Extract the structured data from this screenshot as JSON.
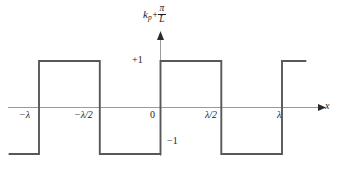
{
  "figure": {
    "width": 338,
    "height": 171,
    "background": "#ffffff",
    "line_color": "#4a4a4a",
    "axis_color": "#8c8c8c",
    "text_color": "#1a1a1a"
  },
  "axes": {
    "y_axis_title": {
      "base": "k",
      "subscript": "p",
      "operator": "+",
      "fraction_numerator": "π",
      "fraction_denominator": "L"
    },
    "x_axis_label": "x",
    "origin_label": "0",
    "y_tick_labels": [
      "+1",
      "−1"
    ],
    "x_tick_labels": [
      "−λ",
      "−λ/2",
      "λ/2",
      "λ"
    ]
  },
  "chart_data": {
    "type": "line",
    "title": "",
    "xlabel": "x",
    "ylabel": "k_p + π/L",
    "grid": false,
    "legend": "none",
    "xlim": [
      -1.25,
      1.32
    ],
    "ylim": [
      -1.6,
      1.9
    ],
    "x_ticks": [
      -1,
      -0.5,
      0,
      0.5,
      1
    ],
    "x_tick_labels": [
      "−λ",
      "−λ/2",
      "0",
      "λ/2",
      "λ"
    ],
    "y_ticks": [
      -1,
      1
    ],
    "y_tick_labels": [
      "−1",
      "+1"
    ],
    "waveform": "square",
    "period_in_x": 1.0,
    "amplitude": 1,
    "x": [
      -1.25,
      -1.0,
      -1.0,
      -0.5,
      -0.5,
      0.0,
      0.0,
      0.5,
      0.5,
      1.0,
      1.0,
      1.2
    ],
    "y": [
      -1,
      -1,
      1,
      1,
      -1,
      -1,
      1,
      1,
      -1,
      -1,
      1,
      1
    ],
    "segments": [
      {
        "from_x": -1.25,
        "to_x": -1.0,
        "level": -1
      },
      {
        "from_x": -1.0,
        "to_x": -0.5,
        "level": 1
      },
      {
        "from_x": -0.5,
        "to_x": 0.0,
        "level": -1
      },
      {
        "from_x": 0.0,
        "to_x": 0.5,
        "level": 1
      },
      {
        "from_x": 0.5,
        "to_x": 1.0,
        "level": -1
      },
      {
        "from_x": 1.0,
        "to_x": 1.2,
        "level": 1
      }
    ]
  }
}
